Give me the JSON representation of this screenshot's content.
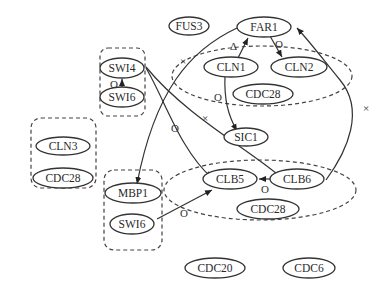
{
  "diagram": {
    "type": "protein interaction network",
    "nodes": {
      "fus3": "FUS3",
      "far1": "FAR1",
      "cln1": "CLN1",
      "cln2": "CLN2",
      "cdc28_a": "CDC28",
      "swi4": "SWI4",
      "swi6_a": "SWI6",
      "sic1": "SIC1",
      "cln3": "CLN3",
      "cdc28_b": "CDC28",
      "mbp1": "MBP1",
      "swi6_b": "SWI6",
      "clb5": "CLB5",
      "clb6": "CLB6",
      "cdc28_c": "CDC28",
      "cdc20": "CDC20",
      "cdc6": "CDC6"
    },
    "complexes": [
      {
        "name": "SWI4-SWI6",
        "members": [
          "SWI4",
          "SWI6"
        ],
        "shape": "rounded-rect"
      },
      {
        "name": "CLN1-CLN2-CDC28",
        "members": [
          "CLN1",
          "CLN2",
          "CDC28"
        ],
        "shape": "ellipse"
      },
      {
        "name": "CLN3-CDC28",
        "members": [
          "CLN3",
          "CDC28"
        ],
        "shape": "rounded-rect"
      },
      {
        "name": "MBP1-SWI6",
        "members": [
          "MBP1",
          "SWI6"
        ],
        "shape": "rounded-rect"
      },
      {
        "name": "CLB5-CLB6-CDC28",
        "members": [
          "CLB5",
          "CLB6",
          "CDC28"
        ],
        "shape": "ellipse"
      }
    ],
    "edge_labels": {
      "swi6_swi4": "O",
      "far1_cln1": "Δ",
      "far1_cln2": "O",
      "cln1_sic1": "O",
      "swi4_far1": "×",
      "swi4_clb5": "O",
      "swi4_clb6": "×",
      "swi6_clb5": "O",
      "clb6_clb5": "O",
      "clb6_far1": "×"
    },
    "edges": [
      {
        "from": "SWI6",
        "to": "SWI4",
        "label": "O"
      },
      {
        "from": "CLN1",
        "to": "FAR1",
        "label": "Δ"
      },
      {
        "from": "FAR1",
        "to": "CLN2",
        "label": "O"
      },
      {
        "from": "CLN1",
        "to": "SIC1",
        "label": "O"
      },
      {
        "from": "FAR1",
        "to": "MBP1",
        "label": "×"
      },
      {
        "from": "SWI4",
        "to": "CLB5",
        "label": "O"
      },
      {
        "from": "SWI4",
        "to": "SIC1",
        "label": "×"
      },
      {
        "from": "SWI6",
        "to": "CLB5",
        "label": "O"
      },
      {
        "from": "CLB6",
        "to": "CLB5",
        "label": "O"
      },
      {
        "from": "CLB6",
        "to": "FAR1",
        "label": "×"
      }
    ]
  }
}
